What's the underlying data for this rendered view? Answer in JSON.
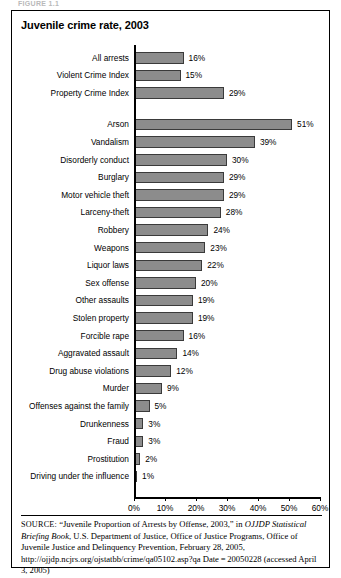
{
  "figure": {
    "caption_label": "FIGURE 1.1",
    "title": "Juvenile crime rate, 2003"
  },
  "chart_data": {
    "type": "bar",
    "orientation": "horizontal",
    "title": "Juvenile crime rate, 2003",
    "xlabel": "",
    "ylabel": "",
    "xlim": [
      0,
      60
    ],
    "xticks": [
      "0%",
      "10%",
      "20%",
      "30%",
      "40%",
      "50%",
      "60%"
    ],
    "xtick_values": [
      0,
      10,
      20,
      30,
      40,
      50,
      60
    ],
    "grid": false,
    "legend": "none",
    "value_suffix": "%",
    "bar_color": "#8c8c8c",
    "bar_border_color": "#3a3a3a",
    "categories": [
      "All arrests",
      "Violent Crime Index",
      "Property Crime Index",
      "Arson",
      "Vandalism",
      "Disorderly conduct",
      "Burglary",
      "Motor vehicle theft",
      "Larceny-theft",
      "Robbery",
      "Weapons",
      "Liquor laws",
      "Sex offense",
      "Other assaults",
      "Stolen property",
      "Forcible rape",
      "Aggravated assault",
      "Drug abuse violations",
      "Murder",
      "Offenses against the family",
      "Drunkenness",
      "Fraud",
      "Prostitution",
      "Driving under the influence"
    ],
    "values": [
      16,
      15,
      29,
      51,
      39,
      30,
      29,
      29,
      28,
      24,
      23,
      22,
      20,
      19,
      19,
      16,
      14,
      12,
      9,
      5,
      3,
      3,
      2,
      1
    ],
    "value_labels": [
      "16%",
      "15%",
      "29%",
      "51%",
      "39%",
      "30%",
      "29%",
      "29%",
      "28%",
      "24%",
      "23%",
      "22%",
      "20%",
      "19%",
      "19%",
      "16%",
      "14%",
      "12%",
      "9%",
      "5%",
      "3%",
      "3%",
      "2%",
      "1%"
    ],
    "group_break_after_index": 2
  },
  "source": {
    "label": "SOURCE:",
    "text_part1": " “Juvenile Proportion of Arrests by Offense, 2003,” in ",
    "italic1": "OJJDP Statistical Briefing Book",
    "text_part2": ", U.S. Department of Justice, Office of Justice Programs, Office of Juvenile Justice and Delinquency Prevention, February 28, 2005, http://ojjdp.ncjrs.org/ojstatbb/crime/qa05102.asp?qa Date = 20050228 (accessed April 3, 2005)"
  }
}
